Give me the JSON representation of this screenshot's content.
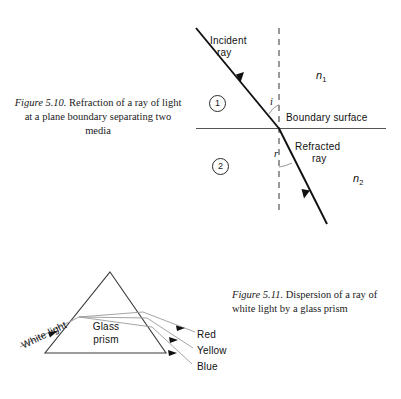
{
  "page": {
    "width": 401,
    "height": 399,
    "background": "#ffffff"
  },
  "figure_510": {
    "caption_label": "Figure 5.10.",
    "caption_text": "Refraction of a ray of light at a plane boundary separating two media",
    "labels": {
      "incident_ray_line1": "Incident",
      "incident_ray_line2": "ray",
      "refracted_ray_line1": "Refracted",
      "refracted_ray_line2": "ray",
      "boundary_surface": "Boundary surface",
      "angle_incidence": "i",
      "angle_refraction": "r",
      "medium_one": "1",
      "medium_two": "2",
      "index_one": "n",
      "index_one_sub": "1",
      "index_two": "n",
      "index_two_sub": "2"
    },
    "colors": {
      "ray": "#111111",
      "boundary": "#555555",
      "normal": "#333333",
      "arc": "#8a8a8a"
    }
  },
  "figure_511": {
    "caption_label": "Figure 5.11.",
    "caption_text": "Dispersion of a ray of white light by a glass prism",
    "labels": {
      "white_light": "White light",
      "glass_line1": "Glass",
      "glass_line2": "prism",
      "red": "Red",
      "yellow": "Yellow",
      "blue": "Blue"
    },
    "colors": {
      "prism_edge": "#3a3a3a",
      "dispersed_ray": "#9a9a9a",
      "white_ray": "#a0a0a0",
      "arrowhead": "#111111"
    }
  }
}
